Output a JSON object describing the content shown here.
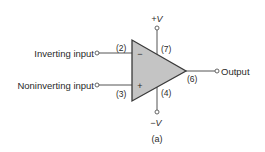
{
  "diagram": {
    "caption": "(a)",
    "inputs": {
      "inverting": {
        "label": "Inverting input",
        "pin": "(2)",
        "sign": "−"
      },
      "noninverting": {
        "label": "Noninverting input",
        "pin": "(3)",
        "sign": "+"
      }
    },
    "supply": {
      "positive": {
        "label": "+V",
        "pin": "(7)"
      },
      "negative": {
        "label": "−V",
        "pin": "(4)"
      }
    },
    "output": {
      "label": "Output",
      "pin": "(6)"
    },
    "colors": {
      "triangle_fill": "#c4c4c4",
      "stroke": "#3a3a3a",
      "text": "#2a2a2a"
    }
  }
}
